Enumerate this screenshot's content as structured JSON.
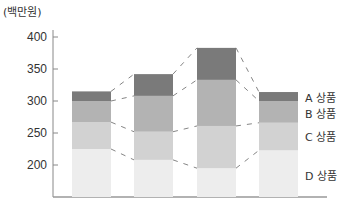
{
  "chart_data": {
    "type": "bar",
    "stacked": true,
    "title": "",
    "unit_label": "(백만원)",
    "xlabel": "",
    "ylabel": "(백만원)",
    "ylim": [
      150,
      400
    ],
    "yticks": [
      200,
      250,
      300,
      350,
      400
    ],
    "categories": [
      "1",
      "2",
      "3",
      "4"
    ],
    "cumulative_tops": {
      "D 상품": [
        225,
        208,
        195,
        223
      ],
      "C 상품": [
        267,
        252,
        261,
        266
      ],
      "B 상품": [
        300,
        308,
        333,
        300
      ],
      "A 상품": [
        315,
        342,
        383,
        314
      ]
    },
    "series": [
      {
        "name": "D 상품",
        "values": [
          225,
          208,
          195,
          223
        ],
        "color": "#ededed"
      },
      {
        "name": "C 상품",
        "values": [
          42,
          44,
          66,
          43
        ],
        "color": "#d2d2d2"
      },
      {
        "name": "B 상품",
        "values": [
          33,
          56,
          72,
          34
        ],
        "color": "#b3b3b3"
      },
      {
        "name": "A 상품",
        "values": [
          15,
          34,
          50,
          14
        ],
        "color": "#7a7a7a"
      }
    ],
    "legend": [
      "A 상품",
      "B 상품",
      "C 상품",
      "D 상품"
    ],
    "legend_position": "right",
    "grid": false,
    "connector_lines": "dashed"
  }
}
